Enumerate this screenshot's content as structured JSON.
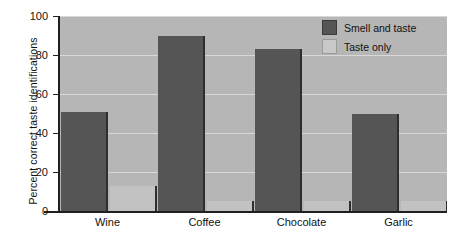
{
  "chart_data": {
    "type": "bar",
    "title": "",
    "xlabel": "",
    "ylabel": "Percent correct taste identifications",
    "categories": [
      "Wine",
      "Coffee",
      "Chocolate",
      "Garlic"
    ],
    "series": [
      {
        "name": "Smell and taste",
        "color": "#555555",
        "values": [
          51,
          90,
          83,
          50
        ]
      },
      {
        "name": "Taste only",
        "color": "#c2c2c2",
        "values": [
          13,
          5,
          5,
          5
        ]
      }
    ],
    "ylim": [
      0,
      100
    ],
    "yticks": [
      0,
      20,
      40,
      60,
      80,
      100
    ],
    "ytick_labels": [
      "0",
      "20",
      "40",
      "60",
      "80",
      "100"
    ],
    "grid": true,
    "grid_axis": "y",
    "legend_position": "top-right",
    "plot_background": "#b6b6b6",
    "figure_background": "#ffffff"
  }
}
